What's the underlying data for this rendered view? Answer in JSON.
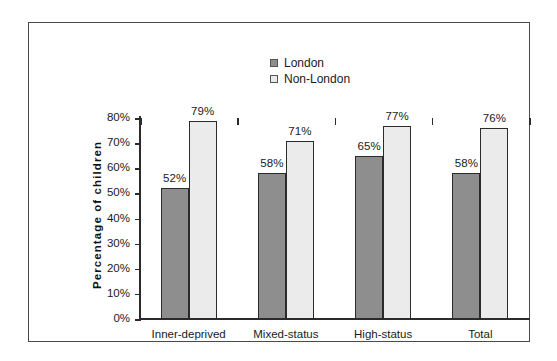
{
  "chart_data": {
    "type": "bar",
    "title": "",
    "subtitle": "",
    "xlabel": "",
    "ylabel": "Percentage of children",
    "categories": [
      "Inner-deprived",
      "Mixed-status",
      "High-status",
      "Total"
    ],
    "series": [
      {
        "name": "London",
        "color": "#8e8e8e",
        "values": [
          52,
          58,
          65,
          58
        ],
        "value_labels": [
          "52%",
          "58%",
          "65%",
          "58%"
        ]
      },
      {
        "name": "Non-London",
        "color": "#ebebeb",
        "values": [
          79,
          71,
          77,
          76
        ],
        "value_labels": [
          "79%",
          "71%",
          "77%",
          "76%"
        ]
      }
    ],
    "ylim": [
      0,
      80
    ],
    "ytick_values": [
      0,
      10,
      20,
      30,
      40,
      50,
      60,
      70,
      80
    ],
    "ytick_labels": [
      "0%",
      "10%",
      "20%",
      "30%",
      "40%",
      "50%",
      "60%",
      "70%",
      "80%"
    ],
    "grid": false,
    "legend_position": "top-center",
    "legend_entries": [
      "London",
      "Non-London"
    ]
  },
  "legend": {
    "entries": [
      {
        "label": "London",
        "swatch": "london-swatch-icon"
      },
      {
        "label": "Non-London",
        "swatch": "non-london-swatch-icon"
      }
    ]
  },
  "axes": {
    "y_title": "Percentage of children"
  },
  "colors": {
    "london_bar": "#8e8e8e",
    "non_london_bar": "#ebebeb",
    "bar_outline": "#2b2b2b",
    "axis": "#2b2b2b",
    "frame": "#4a4a4a",
    "background": "#ffffff",
    "text": "#1a1a1a"
  }
}
